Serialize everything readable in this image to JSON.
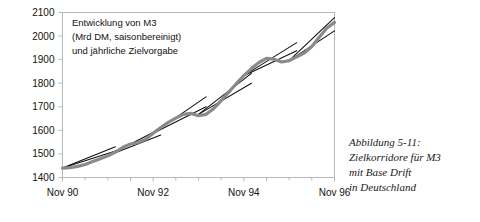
{
  "chart_data": {
    "type": "line",
    "title": "",
    "annotation": [
      "Entwicklung von M3",
      "(Mrd DM, saisonbereinigt)",
      "und jährliche Zielvorgabe"
    ],
    "xlabel": "",
    "ylabel": "",
    "ylim": [
      1400,
      2100
    ],
    "y_ticks": [
      1400,
      1500,
      1600,
      1700,
      1800,
      1900,
      2000,
      2100
    ],
    "y_tick_labels": [
      "1400",
      "1500",
      "1600",
      "1700",
      "1800",
      "1900",
      "2000",
      "2100"
    ],
    "xlim": [
      0,
      72
    ],
    "x_tick_labels": [
      "Nov 90",
      "Nov 92",
      "Nov 94",
      "Nov 96"
    ],
    "x_tick_positions": [
      0,
      24,
      48,
      72
    ],
    "x_minor_tick_positions": [
      6,
      12,
      18,
      30,
      36,
      42,
      54,
      60,
      66
    ],
    "x_unit": "months since Nov 1990",
    "grid": false,
    "legend": null,
    "series": [
      {
        "name": "M3 (Mrd DM, saisonbereinigt)",
        "color": "#8a8a8a",
        "x": [
          0,
          2,
          4,
          6,
          8,
          10,
          12,
          14,
          16,
          18,
          20,
          22,
          24,
          26,
          28,
          30,
          32,
          34,
          36,
          38,
          40,
          42,
          44,
          46,
          48,
          50,
          52,
          54,
          56,
          58,
          60,
          62,
          64,
          66,
          68,
          70,
          72
        ],
        "y": [
          1440,
          1442,
          1447,
          1455,
          1468,
          1480,
          1492,
          1508,
          1528,
          1542,
          1548,
          1562,
          1588,
          1612,
          1634,
          1652,
          1668,
          1672,
          1662,
          1668,
          1692,
          1726,
          1762,
          1798,
          1832,
          1862,
          1888,
          1905,
          1902,
          1890,
          1896,
          1912,
          1928,
          1956,
          1996,
          2034,
          2058
        ]
      }
    ],
    "target_corridors": [
      {
        "name": "Zielvorgabe 1991",
        "x0": 0,
        "y0": 1440,
        "x1": 14,
        "y1_upper": 1530,
        "y1_lower": 1512
      },
      {
        "name": "Zielvorgabe 1992",
        "x0": 12,
        "y0": 1492,
        "x1": 26,
        "y1_upper": 1608,
        "y1_lower": 1580
      },
      {
        "name": "Zielvorgabe 1993",
        "x0": 24,
        "y0": 1588,
        "x1": 38,
        "y1_upper": 1742,
        "y1_lower": 1700
      },
      {
        "name": "Zielvorgabe 1994",
        "x0": 36,
        "y0": 1668,
        "x1": 50,
        "y1_upper": 1842,
        "y1_lower": 1800
      },
      {
        "name": "Zielvorgabe 1995",
        "x0": 48,
        "y0": 1832,
        "x1": 62,
        "y1_upper": 1972,
        "y1_lower": 1938
      },
      {
        "name": "Zielvorgabe 1996",
        "x0": 60,
        "y0": 1896,
        "x1": 72,
        "y1_upper": 2078,
        "y1_lower": 2022
      }
    ]
  },
  "caption": {
    "lines": [
      "Abbildung 5-11:",
      "Zielkorridore für M3",
      "mit Base Drift",
      "in Deutschland"
    ]
  },
  "colors": {
    "series": "#8a8a8a",
    "corridor": "#0d0d0d",
    "frame": "#b8b8b8",
    "text": "#111111"
  }
}
